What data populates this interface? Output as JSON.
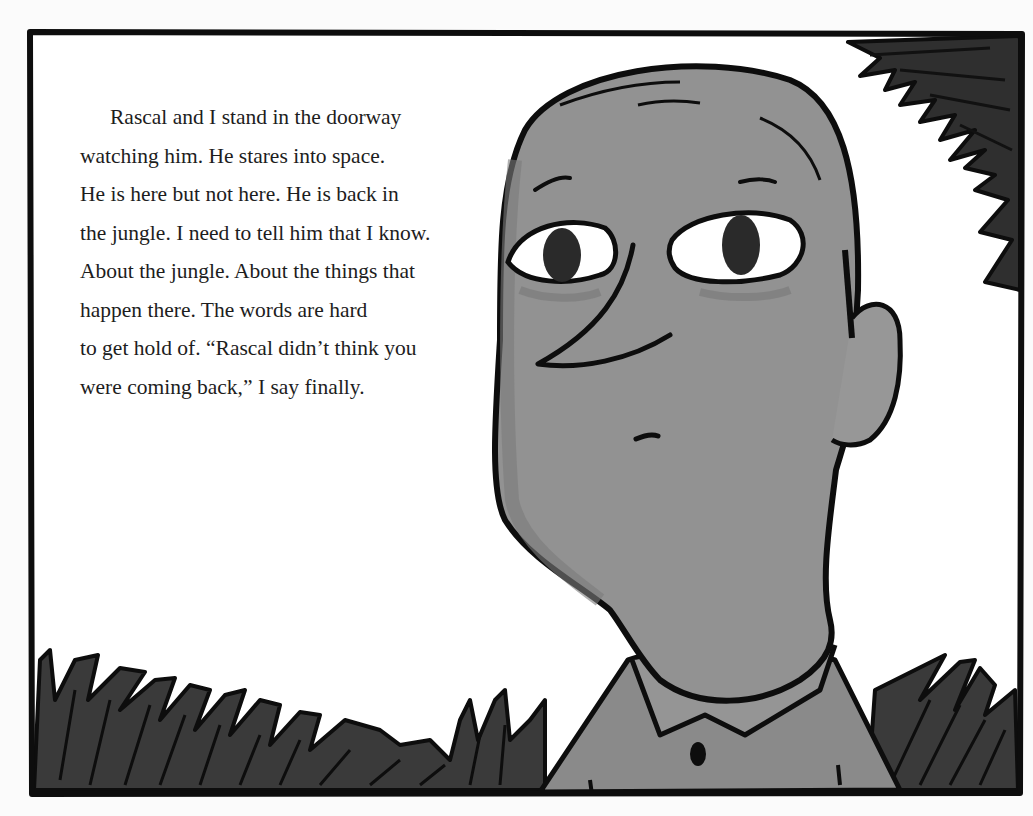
{
  "page": {
    "background": "#fbfbfb",
    "frame_color": "#0d0d0d",
    "skin_color": "#8f8f8f",
    "grass_color": "#3a3a3a"
  },
  "story": {
    "lines": [
      "Rascal and I stand in the doorway",
      "watching him. He stares into space.",
      "He is here but not here. He is back in",
      "the jungle. I need to tell him that I know.",
      "About the jungle. About the things that",
      "happen there. The words are hard",
      "to get hold of. “Rascal didn’t think you",
      "were coming back,” I say finally."
    ]
  },
  "illustration": {
    "subject": "bald man with large eyes and collared shirt looking sideways",
    "elements": [
      "frame-border",
      "man-head",
      "ear",
      "eyes",
      "nose",
      "mouth",
      "shirt-collar",
      "shirt-button",
      "jungle-grass-bottom-left",
      "jungle-grass-bottom-right",
      "jungle-leaves-top-right"
    ]
  }
}
